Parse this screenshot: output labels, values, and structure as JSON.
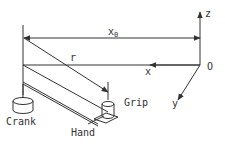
{
  "diagram": {
    "type": "mechanical-schematic",
    "colors": {
      "line": "#333333",
      "background": "#ffffff"
    },
    "labels": {
      "x0": "x",
      "x0_sub": "0",
      "r": "r",
      "x_axis": "x",
      "z_axis": "z",
      "y_axis": "y",
      "origin": "O",
      "crank": "Crank",
      "grip": "Grip",
      "hand": "Hand"
    }
  }
}
